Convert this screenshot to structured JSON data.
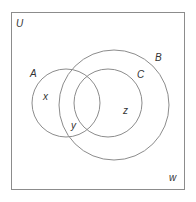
{
  "diagram": {
    "type": "venn",
    "universe": {
      "label": "U",
      "rect": {
        "x": 11.5,
        "y": 12.5,
        "w": 173,
        "h": 177
      }
    },
    "sets": [
      {
        "id": "A",
        "label": "A",
        "cx": 66,
        "cy": 103,
        "r": 34,
        "label_pos": {
          "x": 30,
          "y": 77
        }
      },
      {
        "id": "B",
        "label": "B",
        "cx": 114,
        "cy": 105,
        "r": 55,
        "label_pos": {
          "x": 155,
          "y": 61
        }
      },
      {
        "id": "C",
        "label": "C",
        "cx": 108,
        "cy": 103,
        "r": 34,
        "label_pos": {
          "x": 137,
          "y": 78
        }
      }
    ],
    "elements": [
      {
        "label": "x",
        "x": 43,
        "y": 100
      },
      {
        "label": "y",
        "x": 71,
        "y": 129
      },
      {
        "label": "z",
        "x": 123,
        "y": 114
      },
      {
        "label": "w",
        "x": 169,
        "y": 181
      }
    ],
    "colors": {
      "line": "#8c8c8c",
      "text": "#333333",
      "background": "#ffffff"
    }
  }
}
